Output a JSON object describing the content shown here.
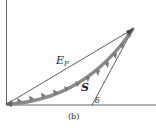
{
  "figure": {
    "caption": "(b)",
    "labels": {
      "ep_main": "E",
      "ep_sub": "P",
      "s": "S",
      "delta": "δ"
    },
    "colors": {
      "axis": "#555555",
      "line": "#333333",
      "curve": "#8a8a8a",
      "text": "#222222"
    }
  }
}
